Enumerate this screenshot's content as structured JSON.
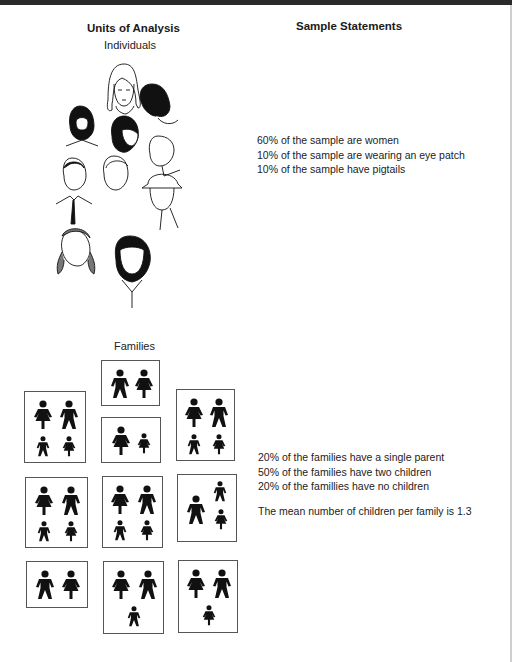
{
  "headers": {
    "left_title": "Units of Analysis",
    "right_title": "Sample Statements"
  },
  "individuals": {
    "label": "Individuals",
    "count": 10,
    "statements": [
      "60% of the sample are women",
      "10% of the sample are wearing an eye patch",
      "10% of the sample have pigtails"
    ]
  },
  "families": {
    "label": "Families",
    "boxes": [
      {
        "members": [
          "man",
          "woman"
        ]
      },
      {
        "members": [
          "woman",
          "man",
          "boy",
          "girl"
        ]
      },
      {
        "members": [
          "woman",
          "girl"
        ]
      },
      {
        "members": [
          "woman",
          "man",
          "boy",
          "girl"
        ]
      },
      {
        "members": [
          "woman",
          "man",
          "boy",
          "girl"
        ]
      },
      {
        "members": [
          "woman",
          "man",
          "boy",
          "girl"
        ]
      },
      {
        "members": [
          "man",
          "boy",
          "girl"
        ]
      },
      {
        "members": [
          "man",
          "woman"
        ]
      },
      {
        "members": [
          "woman",
          "man",
          "boy"
        ]
      },
      {
        "members": [
          "woman",
          "man",
          "girl"
        ]
      }
    ],
    "statements": [
      "20% of the families have a single parent",
      "50% of the families have two children",
      "20% of the famillies have no children"
    ],
    "mean_statement": "The mean number of children per family is 1.3"
  }
}
